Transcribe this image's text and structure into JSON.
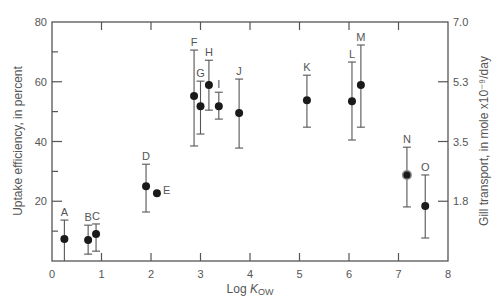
{
  "chart_data": {
    "type": "scatter",
    "title": "",
    "xlabel": "Log K_OW",
    "xlabel_main": "Log ",
    "xlabel_italic": "K",
    "xlabel_sub": "OW",
    "ylabel": "Uptake efficiency, in percent",
    "ylabel_right": "Gill transport, in mole x10⁻⁹/day",
    "xlim": [
      0,
      8
    ],
    "ylim": [
      0,
      80
    ],
    "x_ticks": [
      0,
      1,
      2,
      3,
      4,
      5,
      6,
      7,
      8
    ],
    "y_ticks": [
      20,
      40,
      60,
      80
    ],
    "y_minor_ticks": [
      10,
      30,
      50,
      70
    ],
    "right_ticks": [
      {
        "label": "7.0",
        "y": 80
      },
      {
        "label": "5.3",
        "y": 60
      },
      {
        "label": "3.5",
        "y": 40
      },
      {
        "label": "1.8",
        "y": 20
      }
    ],
    "grid": false,
    "legend": null,
    "series": [
      {
        "name": "compounds",
        "points": [
          {
            "label": "A",
            "x": 0.25,
            "y": 7.4,
            "err_low": 0.0,
            "err_high": 13.7
          },
          {
            "label": "B",
            "x": 0.73,
            "y": 7.0,
            "err_low": 2.3,
            "err_high": 12.0
          },
          {
            "label": "C",
            "x": 0.89,
            "y": 9.0,
            "err_low": 3.3,
            "err_high": 12.4
          },
          {
            "label": "D",
            "x": 1.9,
            "y": 25.0,
            "err_low": 16.4,
            "err_high": 32.4
          },
          {
            "label": "E",
            "x": 2.12,
            "y": 22.7,
            "err_low": null,
            "err_high": null
          },
          {
            "label": "F",
            "x": 2.87,
            "y": 55.2,
            "err_low": 38.5,
            "err_high": 70.6
          },
          {
            "label": "G",
            "x": 3.0,
            "y": 51.8,
            "err_low": 42.5,
            "err_high": 60.2
          },
          {
            "label": "H",
            "x": 3.17,
            "y": 58.9,
            "err_low": 50.5,
            "err_high": 67.2
          },
          {
            "label": "I",
            "x": 3.37,
            "y": 51.8,
            "err_low": 47.5,
            "err_high": 56.5
          },
          {
            "label": "J",
            "x": 3.78,
            "y": 49.5,
            "err_low": 37.8,
            "err_high": 60.9
          },
          {
            "label": "K",
            "x": 5.15,
            "y": 53.8,
            "err_low": 44.8,
            "err_high": 62.2
          },
          {
            "label": "L",
            "x": 6.06,
            "y": 53.5,
            "err_low": 40.5,
            "err_high": 66.6
          },
          {
            "label": "M",
            "x": 6.24,
            "y": 58.9,
            "err_low": 44.8,
            "err_high": 72.3
          },
          {
            "label": "N",
            "x": 7.17,
            "y": 28.8,
            "err_low": 18.1,
            "err_high": 38.1,
            "marker": "ringed"
          },
          {
            "label": "O",
            "x": 7.54,
            "y": 18.4,
            "err_low": 7.7,
            "err_high": 28.8
          }
        ]
      }
    ],
    "colors": {
      "axis": "#555555",
      "marker": "#1a1a1a",
      "errorbar": "#555555",
      "text": "#555555"
    }
  }
}
